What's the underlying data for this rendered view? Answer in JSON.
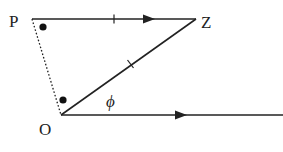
{
  "diagram": {
    "labels": {
      "P": "P",
      "Z": "Z",
      "O": "O",
      "angle": "ϕ"
    },
    "points": {
      "P": [
        32,
        19
      ],
      "Z": [
        196,
        19
      ],
      "O": [
        61,
        115
      ],
      "axis_end": [
        283,
        115
      ]
    },
    "segments": [
      {
        "from": "P",
        "to": "Z",
        "style": "solid",
        "arrow": true,
        "tick": true
      },
      {
        "from": "O",
        "to": "Z",
        "style": "solid",
        "arrow": false,
        "tick": true
      },
      {
        "from": "O",
        "to": "axis_end",
        "style": "solid",
        "arrow": true,
        "tick": false
      },
      {
        "from": "P",
        "to": "O",
        "style": "dotted",
        "arrow": false,
        "tick": false
      }
    ],
    "right_angle_markers": [
      "P",
      "O"
    ],
    "colors": {
      "stroke": "#222222",
      "background": "#ffffff"
    }
  }
}
